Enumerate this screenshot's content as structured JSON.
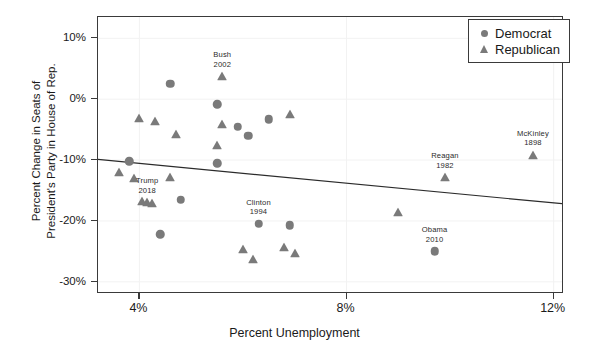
{
  "chart_data": {
    "type": "scatter",
    "title": "",
    "xlabel": "Percent Unemployment",
    "ylabel": "Percent Change in Seats of\nPresident's Party in House of Rep.",
    "ylabel_line1": "Percent Change in Seats of",
    "ylabel_line2": "President's Party in House of Rep.",
    "xlim": [
      3.2,
      12.2
    ],
    "ylim": [
      -32.0,
      13.5
    ],
    "xticks": [
      4,
      8,
      12
    ],
    "xtick_labels": [
      "4%",
      "8%",
      "12%"
    ],
    "yticks": [
      10,
      0,
      -10,
      -20,
      -30
    ],
    "ytick_labels": [
      "10%",
      "0%",
      "-10%",
      "-20%",
      "-30%"
    ],
    "grid": true,
    "legend_position": "top-right",
    "marker_color": "#7a7a7a",
    "trendline_color": "#2b2b2b",
    "series": [
      {
        "name": "Democrat",
        "marker": "circle",
        "points": [
          {
            "x": 4.6,
            "y": 2.5
          },
          {
            "x": 5.5,
            "y": -0.8
          },
          {
            "x": 6.5,
            "y": -3.3
          },
          {
            "x": 5.9,
            "y": -4.5
          },
          {
            "x": 6.1,
            "y": -6.0
          },
          {
            "x": 3.8,
            "y": -10.2
          },
          {
            "x": 5.5,
            "y": -10.5
          },
          {
            "x": 4.8,
            "y": -16.5
          },
          {
            "x": 6.3,
            "y": -20.5
          },
          {
            "x": 6.9,
            "y": -20.7
          },
          {
            "x": 4.4,
            "y": -22.2
          },
          {
            "x": 9.7,
            "y": -25.0
          }
        ]
      },
      {
        "name": "Republican",
        "marker": "triangle",
        "points": [
          {
            "x": 5.6,
            "y": 3.8
          },
          {
            "x": 4.0,
            "y": -3.1
          },
          {
            "x": 4.3,
            "y": -3.6
          },
          {
            "x": 5.6,
            "y": -4.1
          },
          {
            "x": 6.9,
            "y": -2.5
          },
          {
            "x": 4.7,
            "y": -5.8
          },
          {
            "x": 5.5,
            "y": -7.5
          },
          {
            "x": 3.6,
            "y": -11.9
          },
          {
            "x": 3.9,
            "y": -13.0
          },
          {
            "x": 4.6,
            "y": -12.7
          },
          {
            "x": 4.05,
            "y": -16.8
          },
          {
            "x": 4.15,
            "y": -16.9
          },
          {
            "x": 4.25,
            "y": -17.0
          },
          {
            "x": 9.9,
            "y": -12.8
          },
          {
            "x": 11.6,
            "y": -9.1
          },
          {
            "x": 9.0,
            "y": -18.5
          },
          {
            "x": 6.0,
            "y": -24.6
          },
          {
            "x": 6.8,
            "y": -24.2
          },
          {
            "x": 6.2,
            "y": -26.3
          },
          {
            "x": 7.0,
            "y": -25.3
          }
        ]
      }
    ],
    "trendline": {
      "x_start": 3.2,
      "y_start": -9.9,
      "x_end": 12.2,
      "y_end": -17.2
    },
    "annotations": [
      {
        "label_line1": "Bush",
        "label_line2": "2002",
        "x": 5.6,
        "y": 3.8,
        "party": "Republican"
      },
      {
        "label_line1": "Trump",
        "label_line2": "2018",
        "x": 4.15,
        "y": -16.9,
        "party": "Republican"
      },
      {
        "label_line1": "Clinton",
        "label_line2": "1994",
        "x": 6.3,
        "y": -20.5,
        "party": "Democrat"
      },
      {
        "label_line1": "Reagan",
        "label_line2": "1982",
        "x": 9.9,
        "y": -12.8,
        "party": "Republican"
      },
      {
        "label_line1": "McKinley",
        "label_line2": "1898",
        "x": 11.6,
        "y": -9.1,
        "party": "Republican"
      },
      {
        "label_line1": "Obama",
        "label_line2": "2010",
        "x": 9.7,
        "y": -25.0,
        "party": "Democrat"
      }
    ]
  },
  "legend": {
    "items": [
      {
        "label": "Democrat",
        "marker": "circle-marker"
      },
      {
        "label": "Republican",
        "marker": "triangle-marker"
      }
    ]
  },
  "axes": {
    "x_title": "Percent Unemployment",
    "y_title_line1": "Percent Change in Seats of",
    "y_title_line2": "President's Party in House of Rep.",
    "x_tick_labels": [
      "4%",
      "8%",
      "12%"
    ],
    "y_tick_labels": [
      "10%",
      "0%",
      "-10%",
      "-20%",
      "-30%"
    ]
  },
  "annotation_text": {
    "bush_name": "Bush",
    "bush_year": "2002",
    "trump_name": "Trump",
    "trump_year": "2018",
    "clinton_name": "Clinton",
    "clinton_year": "1994",
    "reagan_name": "Reagan",
    "reagan_year": "1982",
    "mckinley_name": "McKinley",
    "mckinley_year": "1898",
    "obama_name": "Obama",
    "obama_year": "2010"
  }
}
